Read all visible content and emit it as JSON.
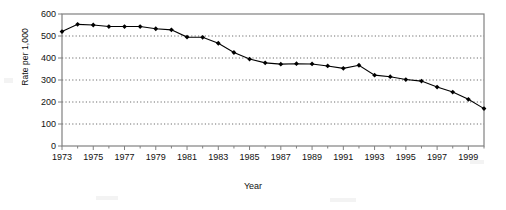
{
  "chart_data": {
    "type": "line",
    "title": "",
    "xlabel": "Year",
    "ylabel": "Rate per 1,000",
    "xlim": [
      1973,
      2000
    ],
    "ylim": [
      0,
      600
    ],
    "grid": true,
    "grid_style": "dotted-horizontal",
    "legend": "none",
    "marker": "filled-diamond",
    "line_color": "#000000",
    "marker_color": "#000000",
    "x": [
      1973,
      1974,
      1975,
      1976,
      1977,
      1978,
      1979,
      1980,
      1981,
      1982,
      1983,
      1984,
      1985,
      1986,
      1987,
      1988,
      1989,
      1990,
      1991,
      1992,
      1993,
      1994,
      1995,
      1996,
      1997,
      1998,
      1999,
      2000
    ],
    "values": [
      520,
      553,
      550,
      543,
      543,
      543,
      533,
      528,
      495,
      494,
      467,
      425,
      395,
      378,
      372,
      374,
      373,
      364,
      353,
      367,
      322,
      315,
      302,
      295,
      268,
      245,
      212,
      170
    ],
    "y_ticks": [
      0,
      100,
      200,
      300,
      400,
      500,
      600
    ],
    "y_tick_labels": [
      "0",
      "100",
      "200",
      "300",
      "400",
      "500",
      "600"
    ],
    "x_ticks": [
      1973,
      1975,
      1977,
      1979,
      1981,
      1983,
      1985,
      1987,
      1989,
      1991,
      1993,
      1995,
      1997,
      1999
    ],
    "x_tick_labels": [
      "1973",
      "1975",
      "1977",
      "1979",
      "1981",
      "1983",
      "1985",
      "1987",
      "1989",
      "1991",
      "1993",
      "1995",
      "1997",
      "1999"
    ]
  },
  "colors": {
    "frame": "#808080",
    "grid": "#6e6e6e",
    "series": "#000000",
    "text": "#111111",
    "background": "#ffffff"
  }
}
